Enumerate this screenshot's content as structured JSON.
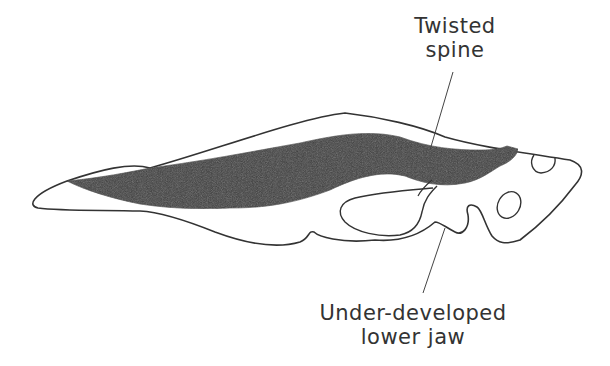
{
  "figure": {
    "colors": {
      "outline": "#333333",
      "spine_fill": "#3a3a3a",
      "background": "#ffffff",
      "label_text": "#333333"
    }
  },
  "labels": {
    "spine": {
      "line1": "Twisted",
      "line2": "spine"
    },
    "jaw": {
      "line1": "Under-developed",
      "line2": "lower jaw"
    }
  }
}
